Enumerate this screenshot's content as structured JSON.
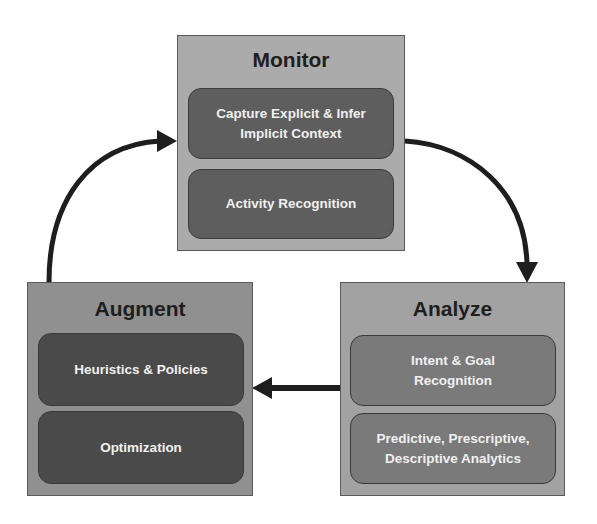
{
  "diagram": {
    "colors": {
      "arrow": "#1e1e1e",
      "monitor_panel": "#ababab",
      "monitor_card": "#5e5e5e",
      "augment_panel": "#909090",
      "augment_card": "#4a4a4a",
      "analyze_panel": "#a2a2a2",
      "analyze_card": "#7a7a7a",
      "card_text": "#f0f0f0",
      "title_text": "#1e1e1e"
    },
    "monitor": {
      "title": "Monitor",
      "items": [
        "Capture Explicit & Infer\nImplicit Context",
        "Activity Recognition"
      ]
    },
    "analyze": {
      "title": "Analyze",
      "items": [
        "Intent  & Goal\nRecognition",
        "Predictive, Prescriptive,\nDescriptive Analytics"
      ]
    },
    "augment": {
      "title": "Augment",
      "items": [
        "Heuristics & Policies",
        "Optimization"
      ]
    },
    "flows": [
      {
        "from": "Monitor",
        "to": "Analyze"
      },
      {
        "from": "Analyze",
        "to": "Augment"
      },
      {
        "from": "Augment",
        "to": "Monitor"
      }
    ]
  }
}
